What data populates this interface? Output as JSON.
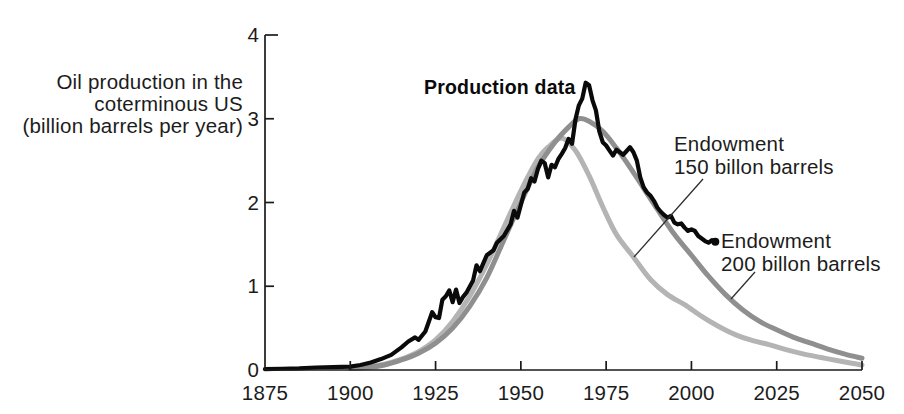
{
  "figure": {
    "y_axis_label_lines": [
      "Oil production in the",
      "coterminous US",
      "(billion barrels per year)"
    ],
    "annotations": {
      "production_data": "Production data",
      "endowment_150": [
        "Endowment",
        "150 billon barrels"
      ],
      "endowment_200": [
        "Endowment",
        "200 billon barrels"
      ]
    }
  },
  "chart_data": {
    "type": "line",
    "title": "",
    "xlabel": "",
    "ylabel": "Oil production in the coterminous US (billion barrels per year)",
    "xlim": [
      1875,
      2050
    ],
    "ylim": [
      0,
      4
    ],
    "x_ticks": [
      "1875",
      "1900",
      "1925",
      "1950",
      "1975",
      "2000",
      "2025",
      "2050"
    ],
    "y_ticks": [
      "0",
      "1",
      "2",
      "3",
      "4"
    ],
    "grid": false,
    "legend_position": "annotated-on-plot",
    "axis_color": "#1a1a1a",
    "series": [
      {
        "name": "Endowment 150 billon barrels",
        "color": "#b4b4b4",
        "width": 5,
        "style": "smooth",
        "points": [
          [
            1900,
            0.02
          ],
          [
            1905,
            0.04
          ],
          [
            1910,
            0.07
          ],
          [
            1915,
            0.13
          ],
          [
            1920,
            0.22
          ],
          [
            1925,
            0.36
          ],
          [
            1930,
            0.58
          ],
          [
            1935,
            0.88
          ],
          [
            1940,
            1.26
          ],
          [
            1945,
            1.7
          ],
          [
            1950,
            2.14
          ],
          [
            1955,
            2.52
          ],
          [
            1958,
            2.66
          ],
          [
            1962,
            2.77
          ],
          [
            1966,
            2.62
          ],
          [
            1970,
            2.32
          ],
          [
            1974,
            1.95
          ],
          [
            1978,
            1.62
          ],
          [
            1983,
            1.35
          ],
          [
            1988,
            1.08
          ],
          [
            1993,
            0.9
          ],
          [
            1998,
            0.78
          ],
          [
            2003,
            0.64
          ],
          [
            2008,
            0.52
          ],
          [
            2013,
            0.42
          ],
          [
            2018,
            0.35
          ],
          [
            2023,
            0.3
          ],
          [
            2028,
            0.24
          ],
          [
            2033,
            0.19
          ],
          [
            2038,
            0.15
          ],
          [
            2043,
            0.11
          ],
          [
            2047,
            0.08
          ],
          [
            2050,
            0.06
          ]
        ]
      },
      {
        "name": "Endowment 200 billon barrels",
        "color": "#8f8f8f",
        "width": 5,
        "style": "smooth",
        "points": [
          [
            1900,
            0.02
          ],
          [
            1905,
            0.03
          ],
          [
            1910,
            0.06
          ],
          [
            1915,
            0.12
          ],
          [
            1920,
            0.2
          ],
          [
            1925,
            0.32
          ],
          [
            1930,
            0.5
          ],
          [
            1935,
            0.76
          ],
          [
            1940,
            1.1
          ],
          [
            1945,
            1.55
          ],
          [
            1950,
            2.0
          ],
          [
            1955,
            2.42
          ],
          [
            1960,
            2.72
          ],
          [
            1964,
            2.9
          ],
          [
            1967,
            3.0
          ],
          [
            1970,
            2.97
          ],
          [
            1974,
            2.85
          ],
          [
            1978,
            2.65
          ],
          [
            1982,
            2.42
          ],
          [
            1986,
            2.17
          ],
          [
            1990,
            1.92
          ],
          [
            1995,
            1.62
          ],
          [
            2000,
            1.37
          ],
          [
            2005,
            1.12
          ],
          [
            2010,
            0.9
          ],
          [
            2015,
            0.72
          ],
          [
            2020,
            0.58
          ],
          [
            2025,
            0.48
          ],
          [
            2030,
            0.39
          ],
          [
            2035,
            0.32
          ],
          [
            2040,
            0.25
          ],
          [
            2045,
            0.19
          ],
          [
            2050,
            0.14
          ]
        ]
      },
      {
        "name": "Production data",
        "color": "#0a0a0a",
        "width": 4.2,
        "style": "jagged",
        "end_marker": true,
        "points": [
          [
            1875,
            0.01
          ],
          [
            1880,
            0.015
          ],
          [
            1885,
            0.02
          ],
          [
            1890,
            0.03
          ],
          [
            1895,
            0.035
          ],
          [
            1900,
            0.04
          ],
          [
            1903,
            0.06
          ],
          [
            1906,
            0.09
          ],
          [
            1909,
            0.13
          ],
          [
            1912,
            0.18
          ],
          [
            1915,
            0.27
          ],
          [
            1917,
            0.34
          ],
          [
            1919,
            0.39
          ],
          [
            1920,
            0.36
          ],
          [
            1922,
            0.46
          ],
          [
            1924,
            0.69
          ],
          [
            1925,
            0.63
          ],
          [
            1926,
            0.62
          ],
          [
            1927,
            0.84
          ],
          [
            1928,
            0.88
          ],
          [
            1929,
            0.95
          ],
          [
            1930,
            0.81
          ],
          [
            1931,
            0.96
          ],
          [
            1932,
            0.8
          ],
          [
            1933,
            0.87
          ],
          [
            1934,
            0.92
          ],
          [
            1936,
            1.07
          ],
          [
            1937,
            1.25
          ],
          [
            1938,
            1.18
          ],
          [
            1940,
            1.37
          ],
          [
            1942,
            1.43
          ],
          [
            1943,
            1.52
          ],
          [
            1945,
            1.6
          ],
          [
            1947,
            1.74
          ],
          [
            1948,
            1.9
          ],
          [
            1949,
            1.82
          ],
          [
            1950,
            1.97
          ],
          [
            1951,
            2.12
          ],
          [
            1952,
            2.16
          ],
          [
            1953,
            2.29
          ],
          [
            1954,
            2.25
          ],
          [
            1955,
            2.4
          ],
          [
            1956,
            2.5
          ],
          [
            1957,
            2.47
          ],
          [
            1958,
            2.3
          ],
          [
            1959,
            2.45
          ],
          [
            1960,
            2.42
          ],
          [
            1961,
            2.52
          ],
          [
            1962,
            2.58
          ],
          [
            1963,
            2.65
          ],
          [
            1964,
            2.76
          ],
          [
            1965,
            2.7
          ],
          [
            1966,
            2.99
          ],
          [
            1967,
            3.16
          ],
          [
            1968,
            3.24
          ],
          [
            1969,
            3.43
          ],
          [
            1970,
            3.4
          ],
          [
            1971,
            3.22
          ],
          [
            1972,
            3.1
          ],
          [
            1973,
            2.85
          ],
          [
            1974,
            2.72
          ],
          [
            1975,
            2.68
          ],
          [
            1976,
            2.62
          ],
          [
            1977,
            2.56
          ],
          [
            1978,
            2.63
          ],
          [
            1979,
            2.6
          ],
          [
            1980,
            2.57
          ],
          [
            1982,
            2.66
          ],
          [
            1983,
            2.6
          ],
          [
            1984,
            2.5
          ],
          [
            1985,
            2.3
          ],
          [
            1986,
            2.18
          ],
          [
            1987,
            2.12
          ],
          [
            1988,
            2.08
          ],
          [
            1989,
            2.02
          ],
          [
            1990,
            1.94
          ],
          [
            1991,
            1.89
          ],
          [
            1992,
            1.85
          ],
          [
            1993,
            1.82
          ],
          [
            1994,
            1.84
          ],
          [
            1995,
            1.76
          ],
          [
            1996,
            1.74
          ],
          [
            1997,
            1.75
          ],
          [
            1998,
            1.7
          ],
          [
            1999,
            1.66
          ],
          [
            2000,
            1.68
          ],
          [
            2001,
            1.66
          ],
          [
            2002,
            1.6
          ],
          [
            2003,
            1.57
          ],
          [
            2004,
            1.54
          ],
          [
            2005,
            1.52
          ],
          [
            2006,
            1.55
          ],
          [
            2007,
            1.53
          ]
        ]
      }
    ]
  }
}
